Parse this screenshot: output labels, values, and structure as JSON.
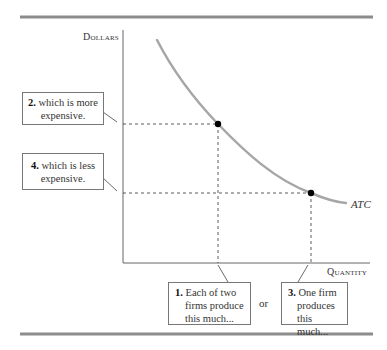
{
  "figure": {
    "y_axis_label": "Dollars",
    "x_axis_label": "Quantity",
    "curve_label": "ATC",
    "callouts": [
      {
        "number": "1.",
        "text": "Each of two firms produce this much...",
        "lines": [
          "Each of two",
          "firms produce",
          "this much..."
        ]
      },
      {
        "number": "2.",
        "text": "which is more expensive.",
        "lines": [
          "which is more",
          "expensive."
        ]
      },
      {
        "number": "3.",
        "text": "One firm produces this much...",
        "lines": [
          "One firm",
          "produces",
          "this much..."
        ]
      },
      {
        "number": "4.",
        "text": "which is less expensive.",
        "lines": [
          "which is less",
          "expensive."
        ]
      }
    ],
    "connector_word": "or",
    "colors": {
      "rule": "#8c8c8c",
      "curve": "#a6a6a6",
      "axis": "#555555",
      "point": "#000000"
    },
    "points": [
      {
        "name": "two-firms-point",
        "x": 218,
        "y": 124
      },
      {
        "name": "one-firm-point",
        "x": 311,
        "y": 193
      }
    ]
  }
}
